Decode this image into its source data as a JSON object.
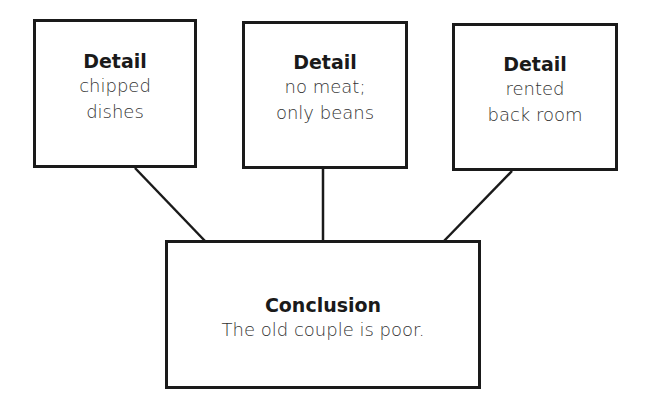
{
  "diagram": {
    "details": [
      {
        "title": "Detail",
        "lines": [
          "chipped",
          "dishes"
        ]
      },
      {
        "title": "Detail",
        "lines": [
          "no meat;",
          "only beans"
        ]
      },
      {
        "title": "Detail",
        "lines": [
          "rented",
          "back room"
        ]
      }
    ],
    "conclusion": {
      "title": "Conclusion",
      "text": "The old couple is poor."
    },
    "colors": {
      "stroke": "#1a1a1a",
      "text": "#333333",
      "background": "#ffffff"
    }
  }
}
